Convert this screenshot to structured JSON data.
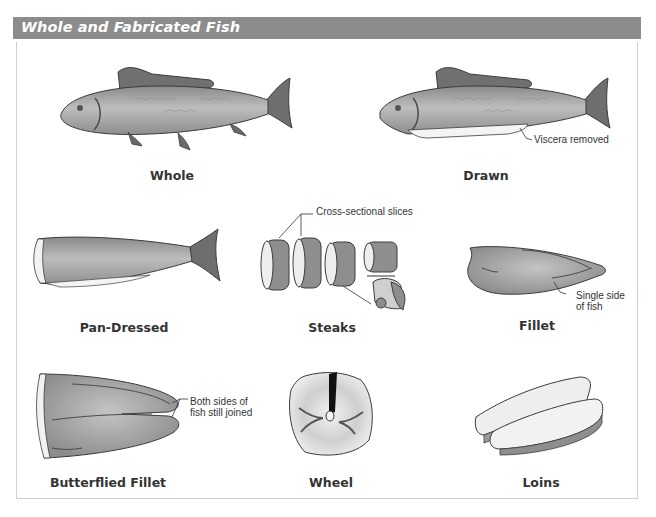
{
  "header": {
    "title": "Whole and Fabricated Fish"
  },
  "colors": {
    "header_bg": "#8c8c8c",
    "fish_body": "#a0a0a0",
    "fish_dark": "#6e6e6e",
    "flesh_light": "#e6e6e6",
    "outline": "#3c3c3c"
  },
  "figures": [
    {
      "id": "whole",
      "label": "Whole"
    },
    {
      "id": "drawn",
      "label": "Drawn",
      "callout": "Viscera removed"
    },
    {
      "id": "pan-dressed",
      "label": "Pan-Dressed"
    },
    {
      "id": "steaks",
      "label": "Steaks",
      "callout": "Cross-sectional slices"
    },
    {
      "id": "fillet",
      "label": "Fillet",
      "callout_lines": [
        "Single side",
        "of fish"
      ]
    },
    {
      "id": "butterflied-fillet",
      "label": "Butterflied Fillet",
      "callout_lines": [
        "Both sides of",
        "fish still joined"
      ]
    },
    {
      "id": "wheel",
      "label": "Wheel"
    },
    {
      "id": "loins",
      "label": "Loins"
    }
  ]
}
